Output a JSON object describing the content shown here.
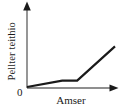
{
  "chart_data": {
    "type": "line",
    "title": "",
    "xlabel": "Amser",
    "ylabel": "Pellter teithio",
    "origin_label": "0",
    "grid": false,
    "legend": null,
    "xlim": [
      0,
      100
    ],
    "ylim": [
      0,
      100
    ],
    "axis_arrows": true,
    "tick_labels": {
      "x": [],
      "y": []
    },
    "series": [
      {
        "name": "Pellter teithio",
        "color": "#1a1a1a",
        "x": [
          0,
          40,
          57,
          100
        ],
        "y": [
          0,
          11,
          11,
          70
        ],
        "description": "Gentle linear rise, then flat plateau, then steep linear rise"
      }
    ],
    "annotations": []
  },
  "axes": {
    "y_axis_name": "y-axis",
    "x_axis_name": "x-axis",
    "color": "#555555"
  }
}
